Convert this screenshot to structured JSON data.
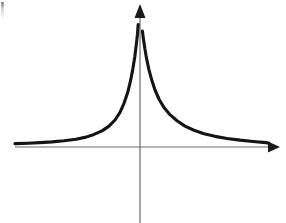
{
  "figure": {
    "kind": "line-graph",
    "background_color": "#ffffff",
    "width": 286,
    "height": 223,
    "title": "",
    "caption": "",
    "artifact_label": "scan edge mark"
  },
  "axes": {
    "color": "#6b6b6b",
    "stroke_width": 1.2,
    "origin": {
      "x": 140,
      "y": 147
    },
    "x_axis": {
      "label": "",
      "start_x": 15,
      "end_x": 272,
      "y": 147,
      "arrow": "right",
      "arrow_tip_x": 280
    },
    "y_axis": {
      "label": "",
      "x": 140,
      "top_y": 14,
      "bottom_y": 223,
      "arrow": "up",
      "arrow_tip_y": 4
    }
  },
  "curve": {
    "color": "#141414",
    "stroke_width": 3.1,
    "description": "symmetric peak with vertical asymptote at x=0",
    "asymptote_vertical_x": 140,
    "asymptote_horizontal_y": 147,
    "left_branch_end": {
      "x": 18,
      "y": 142
    },
    "left_branch_top": {
      "x": 136,
      "y": 10
    },
    "right_branch_top": {
      "x": 145,
      "y": 17
    },
    "right_branch_end": {
      "x": 269,
      "y": 143
    }
  },
  "chart_data": {
    "type": "line",
    "title": "",
    "xlabel": "",
    "ylabel": "",
    "grid": false,
    "legend": null,
    "xlim": [
      -6.3,
      6.6
    ],
    "ylim": [
      0,
      7.0
    ],
    "annotations": [
      "vertical asymptote at x = 0",
      "horizontal asymptote at y = 0",
      "curve is symmetric about the y-axis"
    ],
    "series": [
      {
        "name": "left branch",
        "x": [
          -6.25,
          -5.6,
          -5.0,
          -4.4,
          -3.8,
          -3.2,
          -2.7,
          -2.3,
          -1.9,
          -1.55,
          -1.25,
          -1.0,
          -0.8,
          -0.62,
          -0.48,
          -0.36,
          -0.26,
          -0.19,
          -0.13,
          -0.09
        ],
        "y": [
          0.18,
          0.2,
          0.23,
          0.27,
          0.33,
          0.41,
          0.52,
          0.66,
          0.85,
          1.1,
          1.42,
          1.82,
          2.3,
          2.85,
          3.45,
          4.1,
          4.75,
          5.35,
          5.9,
          6.45
        ]
      },
      {
        "name": "right branch",
        "x": [
          0.12,
          0.17,
          0.24,
          0.33,
          0.44,
          0.58,
          0.75,
          0.96,
          1.2,
          1.5,
          1.85,
          2.25,
          2.7,
          3.2,
          3.75,
          4.35,
          5.0,
          5.65,
          6.3,
          6.45
        ],
        "y": [
          6.1,
          5.7,
          5.2,
          4.65,
          4.1,
          3.55,
          3.0,
          2.5,
          2.08,
          1.7,
          1.38,
          1.1,
          0.88,
          0.7,
          0.56,
          0.45,
          0.36,
          0.29,
          0.23,
          0.2
        ]
      }
    ]
  }
}
